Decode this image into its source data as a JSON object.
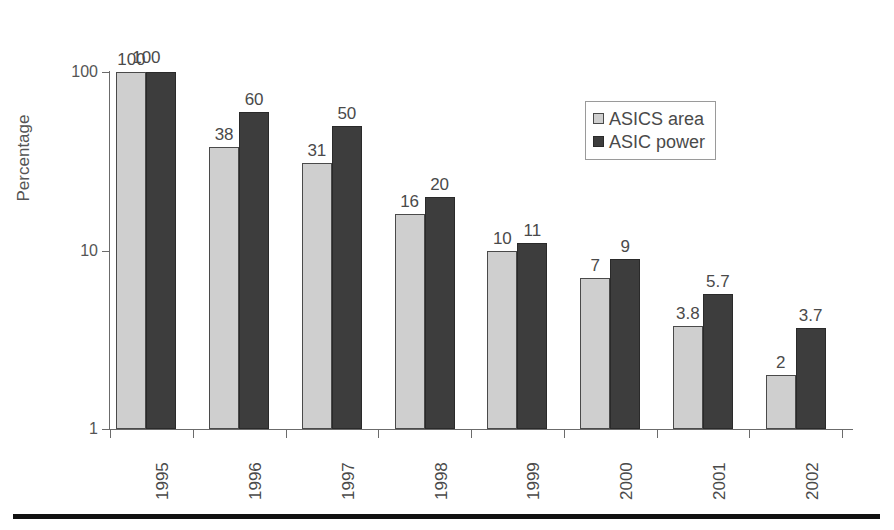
{
  "chart_data": {
    "type": "bar",
    "title": "",
    "subtitle": "",
    "xlabel": "",
    "ylabel": "Percentage",
    "yscale": "log",
    "ylim": [
      1,
      100
    ],
    "ytick_labels": [
      "100",
      "10",
      "1"
    ],
    "ytick_values": [
      100,
      10,
      1
    ],
    "grid": false,
    "legend_position": "top-right",
    "categories": [
      "1995",
      "1996",
      "1997",
      "1998",
      "1999",
      "2000",
      "2001",
      "2002"
    ],
    "series": [
      {
        "name": "ASICS area",
        "color": "#cfcfcf",
        "values": [
          100,
          38,
          31,
          16,
          10,
          7,
          3.8,
          2
        ],
        "labels": [
          "100",
          "38",
          "31",
          "16",
          "10",
          "7",
          "3.8",
          "2"
        ]
      },
      {
        "name": "ASIC power",
        "color": "#3d3d3d",
        "values": [
          100,
          60,
          50,
          20,
          11,
          9,
          5.7,
          3.7
        ],
        "labels": [
          "",
          "60",
          "50",
          "20",
          "11",
          "9",
          "5.7",
          "3.7"
        ]
      }
    ],
    "shared_labels": [
      {
        "category": "1995",
        "text": "100",
        "applies_to": "both"
      }
    ]
  },
  "legend": {
    "items": [
      {
        "label": "ASICS area",
        "swatch": "light-gray-square-icon"
      },
      {
        "label": "ASIC power",
        "swatch": "dark-gray-square-icon"
      }
    ]
  },
  "axes": {
    "y_title": "Percentage",
    "y_ticks": [
      "100",
      "10",
      "1"
    ],
    "x_ticks": [
      "1995",
      "1996",
      "1997",
      "1998",
      "1999",
      "2000",
      "2001",
      "2002"
    ]
  }
}
